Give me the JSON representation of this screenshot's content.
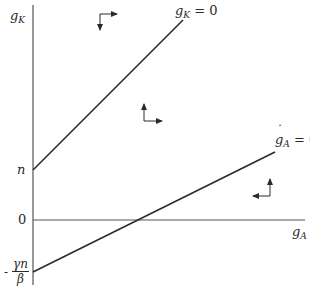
{
  "diagram": {
    "type": "phase-diagram",
    "axes": {
      "y_label": "g",
      "y_label_sub": "K",
      "x_label": "g",
      "x_label_sub": "A"
    },
    "ticks": {
      "n": "n",
      "zero": "0",
      "neg_intercept_sign": "-",
      "neg_intercept_num": "γn",
      "neg_intercept_den": "β"
    },
    "lines": {
      "gK_dot": {
        "symbol": "g",
        "sub": "K",
        "eq": " = 0",
        "y_intercept": "n",
        "slope": "positive, steep"
      },
      "gA_dot": {
        "symbol": "g",
        "sub": "A",
        "eq": " = 0",
        "y_intercept": "-γn/β",
        "slope": "positive, shallow"
      }
    },
    "arrows": [
      {
        "region": "above gK-dot line",
        "horizontal": "right",
        "vertical": "down"
      },
      {
        "region": "between lines",
        "horizontal": "right",
        "vertical": "up"
      },
      {
        "region": "below gA-dot line",
        "horizontal": "left",
        "vertical": "up"
      }
    ],
    "colors": {
      "stroke": "#2a2a2a",
      "background": "#ffffff"
    }
  }
}
